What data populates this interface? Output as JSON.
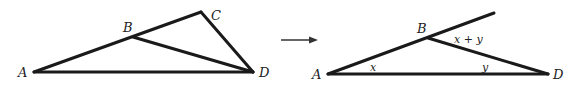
{
  "figure": {
    "left": {
      "points": {
        "A": "A",
        "B": "B",
        "C": "C",
        "D": "D"
      }
    },
    "arrow": "right-arrow",
    "right": {
      "points": {
        "A": "A",
        "B": "B",
        "D": "D"
      },
      "angles": {
        "at_A": "x",
        "at_D": "y",
        "exterior_at_B": "x + y"
      }
    }
  }
}
